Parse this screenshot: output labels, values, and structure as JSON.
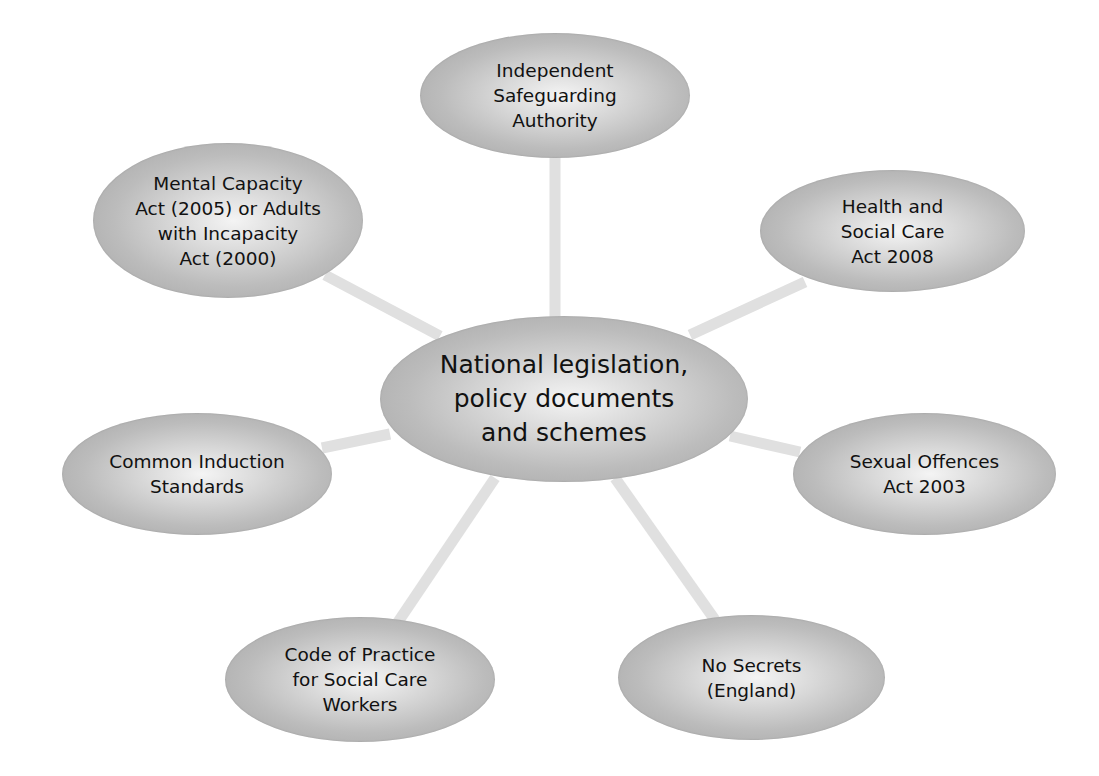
{
  "diagram": {
    "type": "hub-and-spoke",
    "colors": {
      "background": "#ffffff",
      "node_edge": "#a2a2a2",
      "node_highlight": "#f4f4f4",
      "connector": "#e0e0e0",
      "text": "#111111"
    },
    "center": {
      "label": "National legislation,\npolicy documents\nand schemes"
    },
    "nodes": [
      {
        "id": "top",
        "label": "Independent\nSafeguarding\nAuthority"
      },
      {
        "id": "top-right",
        "label": "Health and\nSocial Care\nAct 2008"
      },
      {
        "id": "right",
        "label": "Sexual Offences\nAct 2003"
      },
      {
        "id": "bottom-right",
        "label": "No Secrets\n(England)"
      },
      {
        "id": "bottom-left",
        "label": "Code of Practice\nfor Social Care\nWorkers"
      },
      {
        "id": "left",
        "label": "Common Induction\nStandards"
      },
      {
        "id": "top-left",
        "label": "Mental Capacity\nAct (2005) or Adults\nwith Incapacity\nAct (2000)"
      }
    ]
  }
}
